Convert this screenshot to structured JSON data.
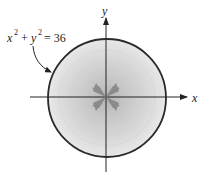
{
  "figure": {
    "equation": {
      "x_var": "x",
      "y_var": "y",
      "exponent": "2",
      "plus": "+",
      "equals": "= 36"
    },
    "x_axis_label": "x",
    "y_axis_label": "y",
    "radius_value": 6,
    "colors": {
      "disk_center": "#b8b8b8",
      "disk_edge": "#e6e6e6",
      "outline": "#2a2a2a",
      "axes": "#222222",
      "arrows": "#8a8a8a"
    }
  }
}
